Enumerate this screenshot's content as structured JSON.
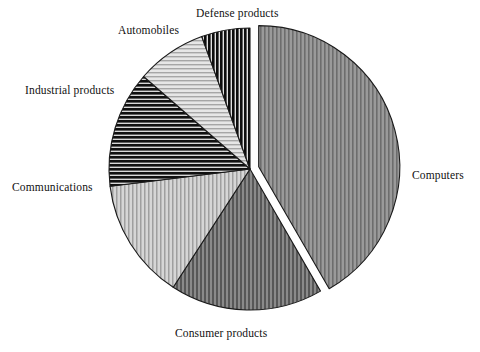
{
  "chart_data": {
    "type": "pie",
    "title": "",
    "subtitle": "",
    "xlabel": "",
    "ylabel": "",
    "legend_position": "none",
    "grid": false,
    "labels_placement": "outside-callout",
    "start_angle_deg": 0,
    "direction": "clockwise",
    "categories": [
      "Computers",
      "Consumer products",
      "Communications",
      "Industrial products",
      "Automobiles",
      "Defense products"
    ],
    "values": [
      41.7,
      17.5,
      13.9,
      13.3,
      8.1,
      5.5
    ],
    "units": "percent",
    "slices": [
      {
        "label": "Computers",
        "value": 41.7,
        "start_angle_deg": 0,
        "end_angle_deg": 150,
        "fill": "vertical-stripes-medium",
        "color": "#878787",
        "exploded": true,
        "explode_offset_px": 9
      },
      {
        "label": "Consumer products",
        "value": 17.5,
        "start_angle_deg": 150,
        "end_angle_deg": 213,
        "fill": "vertical-stripes-dark",
        "color": "#6e6e6e",
        "exploded": false,
        "explode_offset_px": 0
      },
      {
        "label": "Communications",
        "value": 13.9,
        "start_angle_deg": 213,
        "end_angle_deg": 263,
        "fill": "vertical-stripes-light",
        "color": "#b9b9b9",
        "exploded": false,
        "explode_offset_px": 0
      },
      {
        "label": "Industrial products",
        "value": 13.3,
        "start_angle_deg": 263,
        "end_angle_deg": 311,
        "fill": "horizontal-stripes-black",
        "color": "#1a1a1a",
        "exploded": false,
        "explode_offset_px": 0
      },
      {
        "label": "Automobiles",
        "value": 8.1,
        "start_angle_deg": 311,
        "end_angle_deg": 340,
        "fill": "horizontal-stripes-light",
        "color": "#c6c6c6",
        "exploded": false,
        "explode_offset_px": 0
      },
      {
        "label": "Defense products",
        "value": 5.5,
        "start_angle_deg": 340,
        "end_angle_deg": 360,
        "fill": "vertical-stripes-black",
        "color": "#111111",
        "exploded": false,
        "explode_offset_px": 0
      }
    ],
    "geometry": {
      "center_x": 250,
      "center_y": 169,
      "radius": 141
    }
  },
  "labels": {
    "computers": "Computers",
    "consumer_products": "Consumer products",
    "communications": "Communications",
    "industrial_products": "Industrial products",
    "automobiles": "Automobiles",
    "defense_products": "Defense products"
  },
  "colors": {
    "background": "#ffffff",
    "outline": "#1a1a1a",
    "text": "#111111"
  }
}
